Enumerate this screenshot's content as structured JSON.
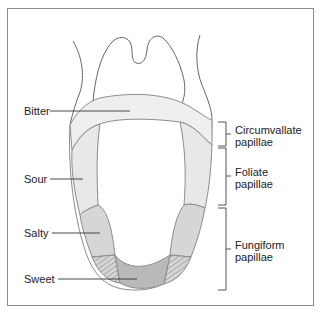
{
  "diagram": {
    "taste_labels": [
      {
        "id": "bitter",
        "label": "Bitter"
      },
      {
        "id": "sour",
        "label": "Sour"
      },
      {
        "id": "salty",
        "label": "Salty"
      },
      {
        "id": "sweet",
        "label": "Sweet"
      }
    ],
    "papillae_labels": [
      {
        "id": "circumvallate",
        "line1": "Circumvallate",
        "line2": "papillae"
      },
      {
        "id": "foliate",
        "line1": "Foliate",
        "line2": "papillae"
      },
      {
        "id": "fungiform",
        "line1": "Fungiform",
        "line2": "papillae"
      }
    ],
    "colors": {
      "outline": "#8c8c8c",
      "bitter_fill": "#efefef",
      "sour_fill": "#e8e8e8",
      "salty_fill": "#d6d6d6",
      "sweet_fill": "#b9b9b9",
      "frame": "#8a8a8a"
    }
  }
}
